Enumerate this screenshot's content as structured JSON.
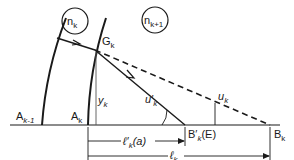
{
  "diagram": {
    "type": "optical-refraction-geometry",
    "media": [
      {
        "id": "n_k",
        "symbol": "n",
        "subscript": "k"
      },
      {
        "id": "n_k_plus_1",
        "symbol": "n",
        "subscript": "k+1"
      }
    ],
    "points": {
      "A_prev": {
        "symbol": "A",
        "subscript": "k-1"
      },
      "A_k": {
        "symbol": "A",
        "subscript": "k"
      },
      "G_k": {
        "symbol": "G",
        "subscript": "k"
      },
      "B_prime_k": {
        "symbol": "B′",
        "subscript": "k",
        "suffix": "(E)"
      },
      "B_k": {
        "symbol": "B",
        "subscript": "k"
      }
    },
    "quantities": {
      "y_k": {
        "symbol": "y",
        "subscript": "k"
      },
      "u_prime_k": {
        "symbol": "u′",
        "subscript": "k"
      },
      "u_k": {
        "symbol": "u",
        "subscript": "k"
      },
      "l_prime_k": {
        "symbol": "ℓ′",
        "subscript": "k",
        "suffix": "(a)"
      },
      "l_k": {
        "symbol": "ℓ",
        "subscript": "k"
      }
    },
    "colors": {
      "stroke": "#1a1a1a",
      "background": "#ffffff"
    }
  }
}
